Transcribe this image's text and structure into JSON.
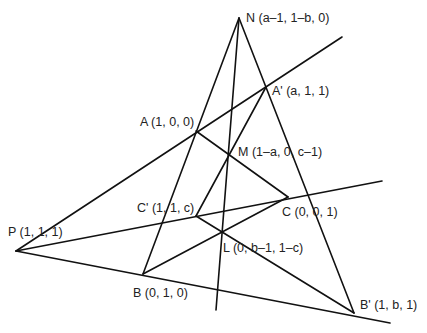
{
  "figure": {
    "points": {
      "N": {
        "label": "N (a–1, 1–b, 0)",
        "x": 239,
        "y": 18
      },
      "A_prime": {
        "label": "A' (a, 1, 1)",
        "x": 266,
        "y": 87
      },
      "A": {
        "label": "A (1, 0, 0)",
        "x": 196,
        "y": 131
      },
      "M": {
        "label": "M (1–a, 0, c–1)",
        "x": 229,
        "y": 154
      },
      "C": {
        "label": "C (0, 0, 1)",
        "x": 288,
        "y": 197
      },
      "C_prime": {
        "label": "C' (1, 1, c)",
        "x": 196,
        "y": 216
      },
      "L": {
        "label": "L (0, b–1, 1–c)",
        "x": 222,
        "y": 233
      },
      "P": {
        "label": "P (1, 1, 1)",
        "x": 16,
        "y": 251
      },
      "B": {
        "label": "B (0, 1, 0)",
        "x": 143,
        "y": 274
      },
      "B_prime": {
        "label": "B' (1, b, 1)",
        "x": 354,
        "y": 313
      }
    },
    "line_color": "#111111",
    "text_color": "#222222"
  }
}
